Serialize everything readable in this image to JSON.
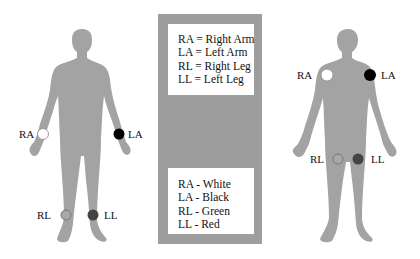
{
  "left_figure": {
    "title": "Limb lead placement",
    "electrodes": [
      {
        "label": "RA",
        "color": "#ffffff"
      },
      {
        "label": "LA",
        "color": "#000000"
      },
      {
        "label": "RL",
        "color": "#9a9a9a"
      },
      {
        "label": "LL",
        "color": "#444444"
      }
    ]
  },
  "legend_abbreviations": {
    "lines": [
      "RA = Right Arm",
      "LA = Left Arm",
      "RL = Right Leg",
      "LL = Left Leg"
    ]
  },
  "legend_colors": {
    "lines": [
      "RA - White",
      "LA - Black",
      "RL - Green",
      "LL - Red"
    ]
  },
  "right_figure": {
    "title": "Torso lead placement",
    "electrodes": [
      {
        "label": "RA",
        "color": "#ffffff"
      },
      {
        "label": "LA",
        "color": "#000000"
      },
      {
        "label": "RL",
        "color": "#9a9a9a"
      },
      {
        "label": "LL",
        "color": "#444444"
      }
    ]
  },
  "colors": {
    "body": "#a3a3a3",
    "panel": "#9e9e9e"
  }
}
